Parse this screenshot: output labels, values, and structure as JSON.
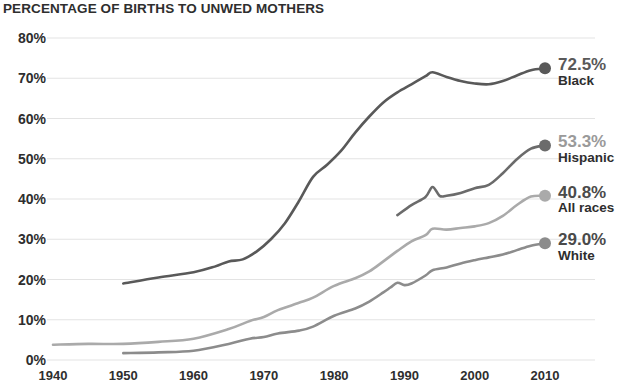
{
  "chart_data": {
    "type": "line",
    "title": "PERCENTAGE OF BIRTHS TO UNWED MOTHERS",
    "xlabel": "",
    "ylabel": "",
    "xlim": [
      1938,
      2012
    ],
    "ylim": [
      0,
      80
    ],
    "grid": true,
    "grid_axis": "y",
    "legend_position": "right-inline-end-labels",
    "x_ticks": [
      1940,
      1950,
      1960,
      1970,
      1980,
      1990,
      2000,
      2010
    ],
    "x_tick_labels": [
      "1940",
      "1950",
      "1960",
      "1970",
      "1980",
      "1990",
      "2000",
      "2010"
    ],
    "y_ticks": [
      0,
      10,
      20,
      30,
      40,
      50,
      60,
      70,
      80
    ],
    "y_tick_labels": [
      "0%",
      "10%",
      "20%",
      "30%",
      "40%",
      "50%",
      "60%",
      "70%",
      "80%"
    ],
    "series": [
      {
        "name": "Black",
        "end_value_label": "72.5%",
        "color": "#595959",
        "x": [
          1950,
          1955,
          1960,
          1963,
          1965,
          1967,
          1969,
          1971,
          1973,
          1975,
          1977,
          1979,
          1981,
          1983,
          1985,
          1987,
          1989,
          1991,
          1993,
          1994,
          1996,
          1998,
          2000,
          2002,
          2004,
          2006,
          2008,
          2010
        ],
        "values": [
          19.0,
          20.5,
          21.8,
          23.2,
          24.5,
          25.0,
          27.0,
          30.0,
          34.0,
          39.5,
          45.5,
          48.5,
          52.0,
          56.5,
          60.5,
          64.0,
          66.5,
          68.5,
          70.5,
          71.5,
          70.3,
          69.3,
          68.7,
          68.5,
          69.3,
          70.7,
          72.0,
          72.5
        ]
      },
      {
        "name": "Hispanic",
        "end_value_label": "53.3%",
        "color": "#6b6b6b",
        "x": [
          1989,
          1991,
          1993,
          1994,
          1995,
          1996,
          1998,
          2000,
          2002,
          2004,
          2006,
          2008,
          2010
        ],
        "values": [
          36.0,
          38.5,
          40.5,
          43.0,
          40.8,
          40.8,
          41.5,
          42.7,
          43.5,
          46.4,
          49.9,
          52.5,
          53.3
        ]
      },
      {
        "name": "All races",
        "end_value_label": "40.8%",
        "color": "#aaaaaa",
        "x": [
          1940,
          1945,
          1950,
          1955,
          1960,
          1965,
          1968,
          1970,
          1972,
          1975,
          1977,
          1980,
          1983,
          1985,
          1987,
          1989,
          1991,
          1993,
          1994,
          1996,
          1998,
          2000,
          2002,
          2004,
          2006,
          2008,
          2010
        ],
        "values": [
          3.8,
          4.0,
          4.0,
          4.5,
          5.3,
          7.7,
          9.7,
          10.7,
          12.4,
          14.2,
          15.5,
          18.4,
          20.3,
          22.0,
          24.5,
          27.1,
          29.5,
          31.0,
          32.6,
          32.4,
          32.8,
          33.2,
          34.0,
          35.8,
          38.5,
          40.6,
          40.8
        ]
      },
      {
        "name": "White",
        "end_value_label": "29.0%",
        "color": "#8c8c8c",
        "x": [
          1950,
          1955,
          1960,
          1965,
          1968,
          1970,
          1972,
          1975,
          1977,
          1980,
          1983,
          1985,
          1987,
          1988,
          1989,
          1990,
          1991,
          1993,
          1994,
          1996,
          1998,
          2000,
          2002,
          2004,
          2006,
          2008,
          2010
        ],
        "values": [
          1.7,
          1.9,
          2.3,
          4.0,
          5.3,
          5.7,
          6.6,
          7.3,
          8.3,
          11.0,
          12.8,
          14.5,
          16.8,
          18.0,
          19.2,
          18.6,
          19.0,
          21.0,
          22.3,
          23.0,
          24.0,
          24.8,
          25.5,
          26.2,
          27.3,
          28.4,
          29.0
        ]
      }
    ]
  },
  "annotations": [
    {
      "value": "72.5%",
      "name": "Black",
      "value_color": "#595959"
    },
    {
      "value": "53.3%",
      "name": "Hispanic",
      "value_color": "#9a9a9a"
    },
    {
      "value": "40.8%",
      "name": "All races",
      "value_color": "#4a4a4a"
    },
    {
      "value": "29.0%",
      "name": "White",
      "value_color": "#4a4a4a"
    }
  ],
  "style": {
    "background": "#ffffff",
    "grid_color": "#e3e3e3",
    "title_color": "#2e2e2e",
    "tick_color": "#2e2e2e"
  }
}
